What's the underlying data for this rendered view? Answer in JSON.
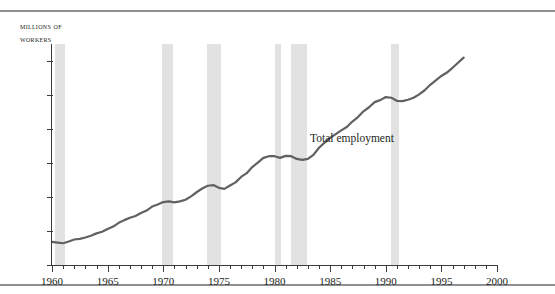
{
  "chart_data": {
    "type": "line",
    "title": "",
    "xlabel": "",
    "ylabel": "Millions of workers",
    "ylabel_lines": [
      "Millions of",
      "workers"
    ],
    "xlim": [
      1960,
      2000
    ],
    "ylim": [
      60,
      125
    ],
    "yticks": [
      60,
      70,
      80,
      90,
      100,
      110,
      120
    ],
    "ytick_labels": [
      "60",
      "70",
      "80",
      "90",
      "100",
      "110",
      "120"
    ],
    "xticks": [
      1960,
      1965,
      1970,
      1975,
      1980,
      1985,
      1990,
      1995,
      2000
    ],
    "xtick_labels": [
      "1960",
      "1965",
      "1970",
      "1975",
      "1980",
      "1985",
      "1990",
      "1995",
      "2000"
    ],
    "x_minor_tick_step": 1,
    "grid": false,
    "legend_position": "inline-annotation",
    "series": [
      {
        "name": "Total employment",
        "color": "#63605e",
        "x": [
          1960.0,
          1960.5,
          1961.0,
          1961.5,
          1962.0,
          1962.5,
          1963.0,
          1963.5,
          1964.0,
          1964.5,
          1965.0,
          1965.5,
          1966.0,
          1966.5,
          1967.0,
          1967.5,
          1968.0,
          1968.5,
          1969.0,
          1969.5,
          1970.0,
          1970.5,
          1971.0,
          1971.5,
          1972.0,
          1972.5,
          1973.0,
          1973.5,
          1974.0,
          1974.5,
          1975.0,
          1975.5,
          1976.0,
          1976.5,
          1977.0,
          1977.5,
          1978.0,
          1978.5,
          1979.0,
          1979.5,
          1980.0,
          1980.5,
          1981.0,
          1981.5,
          1982.0,
          1982.5,
          1983.0,
          1983.5,
          1984.0,
          1984.5,
          1985.0,
          1985.5,
          1986.0,
          1986.5,
          1987.0,
          1987.5,
          1988.0,
          1988.5,
          1989.0,
          1989.5,
          1990.0,
          1990.5,
          1991.0,
          1991.5,
          1992.0,
          1992.5,
          1993.0,
          1993.5,
          1994.0,
          1994.5,
          1995.0,
          1995.5,
          1996.0,
          1996.5,
          1997.0
        ],
        "y": [
          66.8,
          66.6,
          66.4,
          66.9,
          67.5,
          67.7,
          68.1,
          68.6,
          69.3,
          69.8,
          70.6,
          71.3,
          72.4,
          73.2,
          73.9,
          74.4,
          75.3,
          76.0,
          77.2,
          77.8,
          78.5,
          78.7,
          78.4,
          78.7,
          79.2,
          80.2,
          81.4,
          82.5,
          83.3,
          83.5,
          82.7,
          82.4,
          83.4,
          84.3,
          85.9,
          87.0,
          88.8,
          90.1,
          91.5,
          92.0,
          92.0,
          91.5,
          92.1,
          92.0,
          91.2,
          90.9,
          91.2,
          92.4,
          94.5,
          96.0,
          97.4,
          98.5,
          99.6,
          100.6,
          102.2,
          103.5,
          105.2,
          106.4,
          107.9,
          108.5,
          109.4,
          109.2,
          108.3,
          108.2,
          108.6,
          109.2,
          110.2,
          111.4,
          113.0,
          114.3,
          115.6,
          116.6,
          118.0,
          119.5,
          121.0
        ]
      }
    ],
    "shaded_regions": {
      "label": "recession",
      "color": "#e2e2e2",
      "spans": [
        {
          "start": 1960.3,
          "end": 1961.2
        },
        {
          "start": 1969.9,
          "end": 1970.9
        },
        {
          "start": 1973.9,
          "end": 1975.2
        },
        {
          "start": 1980.0,
          "end": 1980.6
        },
        {
          "start": 1981.5,
          "end": 1982.9
        },
        {
          "start": 1990.5,
          "end": 1991.2
        }
      ]
    },
    "annotations": [
      {
        "text": "Total employment",
        "x": 1983.2,
        "y": 97.5
      }
    ]
  },
  "axis": {
    "y_title_line1": "Millions of",
    "y_title_line2": "workers"
  }
}
